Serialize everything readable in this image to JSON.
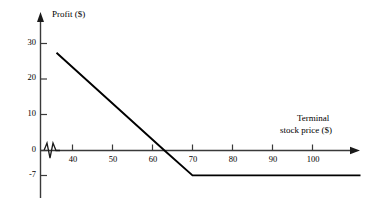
{
  "chart_data": {
    "type": "line",
    "title": "",
    "subtitle": "",
    "xlabel": "Terminal stock price ($)",
    "ylabel": "Profit ($)",
    "xlabel_line1": "Terminal",
    "xlabel_line2": "stock price ($)",
    "xlim": [
      32,
      113
    ],
    "ylim": [
      -12,
      34
    ],
    "xticks": [
      40,
      50,
      60,
      70,
      80,
      90,
      100
    ],
    "xtick_labels": [
      "40",
      "50",
      "60",
      "70",
      "80",
      "90",
      "100"
    ],
    "yticks": [
      30,
      20,
      10,
      0,
      -7
    ],
    "ytick_labels": [
      "30",
      "20",
      "10",
      "0",
      "-7"
    ],
    "grid": false,
    "legend": null,
    "axis_break": {
      "axis": "x",
      "symbol": "zigzag",
      "at": 35
    },
    "series": [
      {
        "name": "Profit",
        "x": [
          36,
          63,
          70,
          112
        ],
        "values": [
          27.5,
          0,
          -7,
          -7
        ]
      }
    ],
    "annotations": [],
    "colors": {
      "line": "#000000",
      "axis": "#3a3a3a",
      "background": "#ffffff"
    }
  }
}
